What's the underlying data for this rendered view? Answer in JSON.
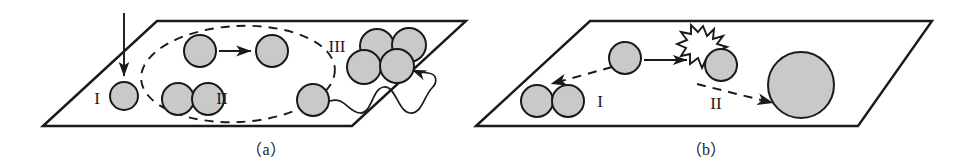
{
  "figure": {
    "name": "particle-growth-mechanism-diagram",
    "colors": {
      "sphere_fill": "#c9c9c9",
      "sphere_stroke": "#1a1a1a",
      "surface_stroke": "#1a1a1a",
      "background": "#ffffff",
      "starburst_fill": "#ffffff"
    },
    "panels": [
      {
        "id": "a",
        "label": "（a）",
        "stage_labels": [
          {
            "id": "a-I",
            "text": "I",
            "x": 97,
            "y": 104
          },
          {
            "id": "a-II",
            "text": "II",
            "x": 222,
            "y": 104
          },
          {
            "id": "a-III",
            "text": "III",
            "x": 337,
            "y": 52
          }
        ],
        "spheres": [
          {
            "id": "a-nucleus",
            "cx": 124,
            "cy": 96,
            "r": 14
          },
          {
            "id": "a-pair-upper-left",
            "cx": 200,
            "cy": 51,
            "r": 16
          },
          {
            "id": "a-pair-upper-right",
            "cx": 272,
            "cy": 51,
            "r": 16
          },
          {
            "id": "a-pair-lower-left",
            "cx": 178,
            "cy": 99,
            "r": 16
          },
          {
            "id": "a-pair-lower-right",
            "cx": 208,
            "cy": 99,
            "r": 16
          },
          {
            "id": "a-diffusing",
            "cx": 313,
            "cy": 100,
            "r": 16
          },
          {
            "id": "a-cluster-top-left",
            "cx": 377,
            "cy": 46,
            "r": 17
          },
          {
            "id": "a-cluster-top-right",
            "cx": 409,
            "cy": 45,
            "r": 17
          },
          {
            "id": "a-cluster-bot-left",
            "cx": 364,
            "cy": 67,
            "r": 17
          },
          {
            "id": "a-cluster-bot-right",
            "cx": 397,
            "cy": 66,
            "r": 17
          }
        ],
        "annotations": [
          {
            "id": "a-deposition-arrow",
            "type": "solid-arrow-down",
            "desc": "vertical incoming flux arrow"
          },
          {
            "id": "a-coalescence-arrow",
            "type": "solid-arrow-right",
            "desc": "arrow between the two upper spheres"
          },
          {
            "id": "a-dashed-boundary",
            "type": "dashed-ellipse",
            "desc": "dashed oval enclosing stage II"
          },
          {
            "id": "a-surface-diffusion-path",
            "type": "wavy-arrow",
            "desc": "wavy path from diffusing sphere to cluster"
          }
        ]
      },
      {
        "id": "b",
        "label": "（b）",
        "stage_labels": [
          {
            "id": "b-I",
            "text": "I",
            "x": 600,
            "y": 107
          },
          {
            "id": "b-II",
            "text": "II",
            "x": 716,
            "y": 109
          }
        ],
        "spheres": [
          {
            "id": "b-pair-left",
            "cx": 537,
            "cy": 101,
            "r": 16
          },
          {
            "id": "b-pair-right",
            "cx": 568,
            "cy": 101,
            "r": 16
          },
          {
            "id": "b-incoming",
            "cx": 625,
            "cy": 58,
            "r": 16
          },
          {
            "id": "b-impacted",
            "cx": 721,
            "cy": 65,
            "r": 16
          },
          {
            "id": "b-large",
            "cx": 801,
            "cy": 85,
            "r": 33
          }
        ],
        "annotations": [
          {
            "id": "b-impact-arrow",
            "type": "solid-arrow-right",
            "desc": "arrow from incoming sphere to impact point"
          },
          {
            "id": "b-starburst",
            "type": "starburst",
            "desc": "collision flash / impact event"
          },
          {
            "id": "b-fragmentation-arrow",
            "type": "dashed-arrow-left",
            "desc": "dashed arrow toward the sphere pair (stage I)"
          },
          {
            "id": "b-growth-arrow",
            "type": "dashed-arrow-right",
            "desc": "dashed arrow toward the large sphere (stage II)"
          }
        ]
      }
    ]
  }
}
